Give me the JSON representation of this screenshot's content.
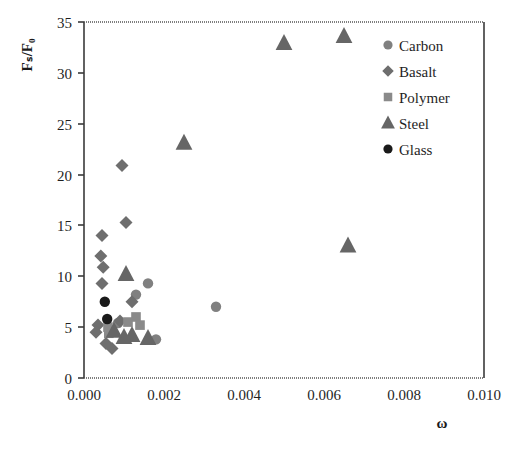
{
  "chart_data": {
    "type": "scatter",
    "title": "",
    "xlabel": "ω",
    "ylabel": "Fₛ/F₀",
    "xlim": [
      0.0,
      0.01
    ],
    "ylim": [
      0,
      35
    ],
    "xticks": [
      "0.000",
      "0.002",
      "0.004",
      "0.006",
      "0.008",
      "0.010"
    ],
    "xtick_values": [
      0.0,
      0.002,
      0.004,
      0.006,
      0.008,
      0.01
    ],
    "yticks": [
      "0",
      "5",
      "10",
      "15",
      "20",
      "25",
      "30",
      "35"
    ],
    "ytick_values": [
      0,
      5,
      10,
      15,
      20,
      25,
      30,
      35
    ],
    "grid": false,
    "legend_position": "top-right-inside",
    "series": [
      {
        "name": "Carbon",
        "marker": "circle",
        "color": "#808080",
        "points": [
          {
            "x": 0.0016,
            "y": 9.3
          },
          {
            "x": 0.0018,
            "y": 3.8
          },
          {
            "x": 0.0013,
            "y": 8.2
          },
          {
            "x": 0.0033,
            "y": 7.0
          },
          {
            "x": 0.00085,
            "y": 5.4
          }
        ]
      },
      {
        "name": "Basalt",
        "marker": "diamond",
        "color": "#6e6e6e",
        "points": [
          {
            "x": 0.00095,
            "y": 20.9
          },
          {
            "x": 0.00105,
            "y": 15.3
          },
          {
            "x": 0.00045,
            "y": 14.0
          },
          {
            "x": 0.00042,
            "y": 12.0
          },
          {
            "x": 0.00048,
            "y": 10.9
          },
          {
            "x": 0.00045,
            "y": 9.3
          },
          {
            "x": 0.00035,
            "y": 5.2
          },
          {
            "x": 0.0003,
            "y": 4.5
          },
          {
            "x": 0.00055,
            "y": 3.4
          },
          {
            "x": 0.0007,
            "y": 2.9
          },
          {
            "x": 0.0012,
            "y": 7.5
          },
          {
            "x": 0.0009,
            "y": 5.6
          }
        ]
      },
      {
        "name": "Polymer",
        "marker": "square",
        "color": "#8a8a8a",
        "points": [
          {
            "x": 0.0013,
            "y": 6.0
          },
          {
            "x": 0.0014,
            "y": 5.2
          },
          {
            "x": 0.0011,
            "y": 5.5
          },
          {
            "x": 0.0006,
            "y": 5.0
          },
          {
            "x": 0.00062,
            "y": 4.4
          }
        ]
      },
      {
        "name": "Steel",
        "marker": "triangle",
        "color": "#666666",
        "points": [
          {
            "x": 0.005,
            "y": 32.9
          },
          {
            "x": 0.0065,
            "y": 33.6
          },
          {
            "x": 0.0025,
            "y": 23.1
          },
          {
            "x": 0.0066,
            "y": 13.0
          },
          {
            "x": 0.00105,
            "y": 10.2
          },
          {
            "x": 0.0012,
            "y": 4.2
          },
          {
            "x": 0.001,
            "y": 4.0
          },
          {
            "x": 0.0016,
            "y": 3.9
          },
          {
            "x": 0.00075,
            "y": 4.6
          }
        ]
      },
      {
        "name": "Glass",
        "marker": "filled-circle",
        "color": "#1a1a1a",
        "points": [
          {
            "x": 0.00052,
            "y": 7.5
          },
          {
            "x": 0.00058,
            "y": 5.8
          }
        ]
      }
    ]
  },
  "legend": {
    "entries": [
      {
        "label": "Carbon",
        "marker": "circle",
        "color": "#808080"
      },
      {
        "label": "Basalt",
        "marker": "diamond",
        "color": "#6e6e6e"
      },
      {
        "label": "Polymer",
        "marker": "square",
        "color": "#8a8a8a"
      },
      {
        "label": "Steel",
        "marker": "triangle",
        "color": "#666666"
      },
      {
        "label": "Glass",
        "marker": "filled-circle",
        "color": "#1a1a1a"
      }
    ]
  }
}
